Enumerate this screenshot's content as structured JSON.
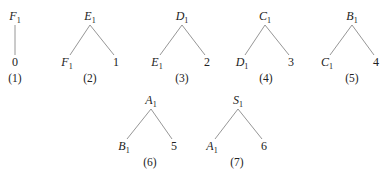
{
  "diagram": {
    "type": "parse-tree-sequence",
    "trees": [
      {
        "caption": "(1)",
        "root": {
          "base": "F",
          "sub": "1",
          "x": 15,
          "y": 20
        },
        "children": [
          {
            "kind": "num",
            "text": "0",
            "x": 15,
            "y": 66
          }
        ],
        "caption_pos": {
          "x": 15,
          "y": 82
        }
      },
      {
        "caption": "(2)",
        "root": {
          "base": "E",
          "sub": "1",
          "x": 90,
          "y": 20
        },
        "children": [
          {
            "kind": "var",
            "base": "F",
            "sub": "1",
            "x": 67,
            "y": 66
          },
          {
            "kind": "num",
            "text": "1",
            "x": 116,
            "y": 66
          }
        ],
        "caption_pos": {
          "x": 90,
          "y": 82
        }
      },
      {
        "caption": "(3)",
        "root": {
          "base": "D",
          "sub": "1",
          "x": 182,
          "y": 20
        },
        "children": [
          {
            "kind": "var",
            "base": "E",
            "sub": "1",
            "x": 157,
            "y": 66
          },
          {
            "kind": "num",
            "text": "2",
            "x": 207,
            "y": 66
          }
        ],
        "caption_pos": {
          "x": 182,
          "y": 82
        }
      },
      {
        "caption": "(4)",
        "root": {
          "base": "C",
          "sub": "1",
          "x": 265,
          "y": 20
        },
        "children": [
          {
            "kind": "var",
            "base": "D",
            "sub": "1",
            "x": 242,
            "y": 66
          },
          {
            "kind": "num",
            "text": "3",
            "x": 291,
            "y": 66
          }
        ],
        "caption_pos": {
          "x": 266,
          "y": 82
        }
      },
      {
        "caption": "(5)",
        "root": {
          "base": "B",
          "sub": "1",
          "x": 352,
          "y": 20
        },
        "children": [
          {
            "kind": "var",
            "base": "C",
            "sub": "1",
            "x": 327,
            "y": 66
          },
          {
            "kind": "num",
            "text": "4",
            "x": 376,
            "y": 66
          }
        ],
        "caption_pos": {
          "x": 352,
          "y": 82
        }
      },
      {
        "caption": "(6)",
        "root": {
          "base": "A",
          "sub": "1",
          "x": 151,
          "y": 104
        },
        "children": [
          {
            "kind": "var",
            "base": "B",
            "sub": "1",
            "x": 124,
            "y": 150
          },
          {
            "kind": "num",
            "text": "5",
            "x": 174,
            "y": 150
          }
        ],
        "caption_pos": {
          "x": 150,
          "y": 166
        }
      },
      {
        "caption": "(7)",
        "root": {
          "base": "S",
          "sub": "1",
          "x": 238,
          "y": 104
        },
        "children": [
          {
            "kind": "var",
            "base": "A",
            "sub": "1",
            "x": 212,
            "y": 150
          },
          {
            "kind": "num",
            "text": "6",
            "x": 264,
            "y": 150
          }
        ],
        "caption_pos": {
          "x": 237,
          "y": 166
        }
      }
    ]
  }
}
